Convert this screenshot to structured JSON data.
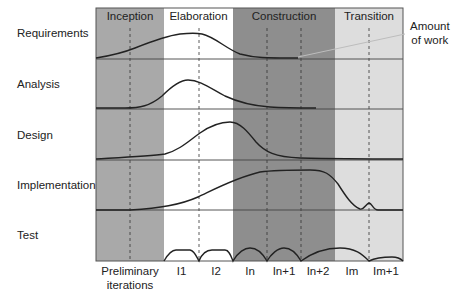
{
  "diagram": {
    "phases": [
      {
        "label": "Inception",
        "x0": 96,
        "x1": 164,
        "color": "#a9a9a9"
      },
      {
        "label": "Elaboration",
        "x0": 164,
        "x1": 233,
        "color": "#ffffff"
      },
      {
        "label": "Construction",
        "x0": 233,
        "x1": 335,
        "color": "#8e8e8e"
      },
      {
        "label": "Transition",
        "x0": 335,
        "x1": 403,
        "color": "#dddddd"
      }
    ],
    "disciplines": [
      {
        "label": "Requirements"
      },
      {
        "label": "Analysis"
      },
      {
        "label": "Design"
      },
      {
        "label": "Implementation"
      },
      {
        "label": "Test"
      }
    ],
    "iterations": [
      {
        "label": "Preliminary\niterations"
      },
      {
        "label": "I1"
      },
      {
        "label": "I2"
      },
      {
        "label": "In"
      },
      {
        "label": "In+1"
      },
      {
        "label": "In+2"
      },
      {
        "label": "Im"
      },
      {
        "label": "Im+1"
      }
    ],
    "annotation": {
      "line1": "Amount",
      "line2": "of work"
    },
    "colors": {
      "line": "#222222",
      "grid": "#444444",
      "annotation_line": "#bdbdbd"
    }
  }
}
